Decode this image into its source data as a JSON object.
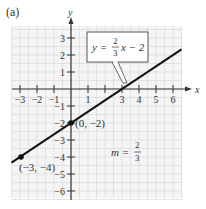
{
  "panel_label": "(a)",
  "axes": {
    "x_label": "x",
    "y_label": "y",
    "x_ticks": [
      "-3",
      "-2",
      "-1",
      "1",
      "3",
      "4",
      "5",
      "6"
    ],
    "y_ticks": [
      "3",
      "2",
      "1",
      "-1",
      "-2",
      "-3",
      "-4",
      "-5",
      "-6"
    ]
  },
  "equation": {
    "lhs": "y =",
    "num": "2",
    "den": "3",
    "rhs": "x − 2"
  },
  "points": [
    {
      "label": "(0, −2)",
      "x": 0,
      "y": -2
    },
    {
      "label": "(−3, −4)",
      "x": -3,
      "y": -4
    }
  ],
  "slope": {
    "lhs": "m =",
    "num": "2",
    "den": "3"
  },
  "colors": {
    "line": "#111111",
    "grid": "#e2e2e2",
    "background": "#f4f4f4",
    "axis": "#333333"
  },
  "chart_data": {
    "type": "line",
    "title": "(a)",
    "xlabel": "x",
    "ylabel": "y",
    "xlim": [
      -3.5,
      6.5
    ],
    "ylim": [
      -6.5,
      3.5
    ],
    "grid": true,
    "series": [
      {
        "name": "y = (2/3)x − 2",
        "x": [
          -3.5,
          6.5
        ],
        "y": [
          -4.333,
          2.333
        ]
      }
    ],
    "marked_points": [
      {
        "label": "(0, −2)",
        "x": 0,
        "y": -2
      },
      {
        "label": "(−3, −4)",
        "x": -3,
        "y": -4
      }
    ],
    "annotations": [
      "y = (2/3)x − 2",
      "m = 2/3",
      "(0, −2)",
      "(−3, −4)"
    ],
    "x_ticks": [
      -3,
      -2,
      -1,
      1,
      3,
      4,
      5,
      6
    ],
    "y_ticks": [
      3,
      2,
      1,
      -1,
      -2,
      -3,
      -4,
      -5,
      -6
    ]
  }
}
